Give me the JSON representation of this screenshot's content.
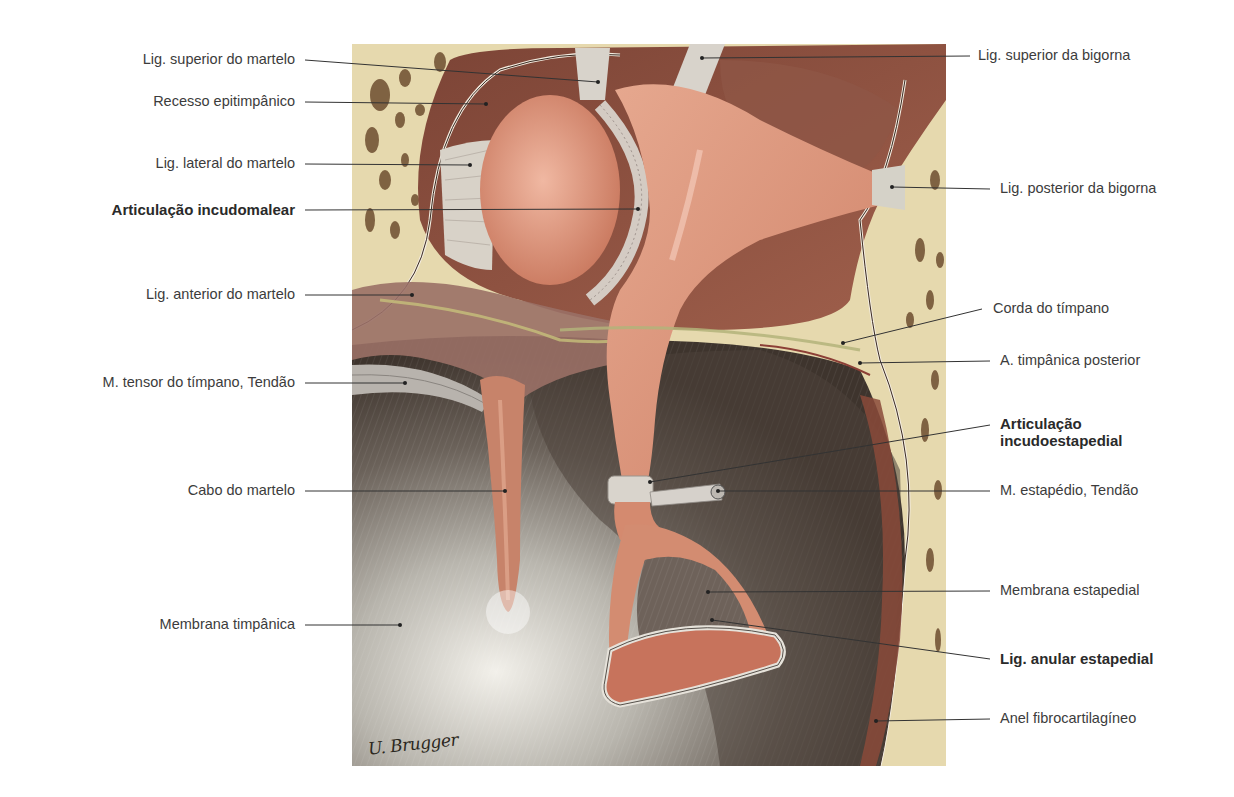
{
  "figure": {
    "illustration": {
      "x": 352,
      "y": 44,
      "width": 594,
      "height": 722
    },
    "artist_signature": "U. Brugger",
    "colors": {
      "bone": "#e8dcb2",
      "bone_pore": "#6a4a2c",
      "ossicle": "#d88e72",
      "ossicle_light": "#eab29c",
      "cavity_dark": "#6b3a2e",
      "membrane_light": "#c8c6c0",
      "membrane_dark": "#4a4038",
      "ligament": "#d9d4cc",
      "leader_line": "#333333"
    }
  },
  "labels_left": [
    {
      "text": "Lig. superior do martelo",
      "bold": false,
      "x_right": 295,
      "y": 60,
      "line": [
        305,
        60,
        598,
        82
      ]
    },
    {
      "text": "Recesso epitimpânico",
      "bold": false,
      "x_right": 295,
      "y": 102,
      "line": [
        305,
        102,
        486,
        104
      ]
    },
    {
      "text": "Lig. lateral do martelo",
      "bold": false,
      "x_right": 295,
      "y": 164,
      "line": [
        305,
        164,
        470,
        165
      ]
    },
    {
      "text": "Articulação incudomalear",
      "bold": true,
      "x_right": 295,
      "y": 210,
      "line": [
        305,
        210,
        638,
        209
      ]
    },
    {
      "text": "Lig. anterior do martelo",
      "bold": false,
      "x_right": 295,
      "y": 295,
      "line": [
        305,
        295,
        412,
        295
      ]
    },
    {
      "text": "M. tensor do tímpano, Tendão",
      "bold": false,
      "x_right": 295,
      "y": 383,
      "line": [
        305,
        383,
        405,
        383
      ]
    },
    {
      "text": "Cabo do martelo",
      "bold": false,
      "x_right": 295,
      "y": 491,
      "line": [
        305,
        491,
        505,
        491
      ]
    },
    {
      "text": "Membrana timpânica",
      "bold": false,
      "x_right": 295,
      "y": 625,
      "line": [
        305,
        625,
        400,
        625
      ]
    }
  ],
  "labels_right": [
    {
      "text": "Lig. superior da bigorna",
      "bold": false,
      "x_left": 978,
      "y": 56,
      "line": [
        702,
        58,
        970,
        56
      ]
    },
    {
      "text": "Lig. posterior da bigorna",
      "bold": false,
      "x_left": 1000,
      "y": 189,
      "line": [
        892,
        187,
        990,
        189
      ]
    },
    {
      "text": "Corda do tímpano",
      "bold": false,
      "x_left": 993,
      "y": 309,
      "line": [
        843,
        343,
        982,
        309
      ]
    },
    {
      "text": "A. timpânica posterior",
      "bold": false,
      "x_left": 1000,
      "y": 361,
      "line": [
        860,
        363,
        990,
        361
      ]
    },
    {
      "text": "Articulação\nincudoestapedial",
      "bold": true,
      "x_left": 1000,
      "y": 432,
      "line": [
        650,
        482,
        990,
        425
      ]
    },
    {
      "text": "M. estapédio, Tendão",
      "bold": false,
      "x_left": 1000,
      "y": 491,
      "line": [
        718,
        491,
        990,
        491
      ]
    },
    {
      "text": "Membrana estapedial",
      "bold": false,
      "x_left": 1000,
      "y": 591,
      "line": [
        708,
        592,
        990,
        591
      ]
    },
    {
      "text": "Lig. anular estapedial",
      "bold": true,
      "x_left": 1000,
      "y": 659,
      "line": [
        712,
        620,
        990,
        659
      ]
    },
    {
      "text": "Anel fibrocartilagíneo",
      "bold": false,
      "x_left": 1000,
      "y": 719,
      "line": [
        876,
        721,
        990,
        719
      ]
    }
  ]
}
